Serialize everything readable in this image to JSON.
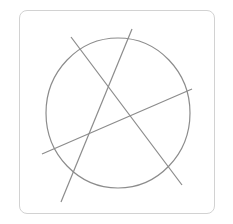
{
  "figure": {
    "stroke_color": "#8c8c8c",
    "frame_color": "#d2d2d2",
    "circle": {
      "cx": 118,
      "cy": 113,
      "rx": 72,
      "ry": 75
    },
    "lines": [
      {
        "x1": 71,
        "y1": 37,
        "x2": 182,
        "y2": 185
      },
      {
        "x1": 132,
        "y1": 29,
        "x2": 61,
        "y2": 202
      },
      {
        "x1": 42,
        "y1": 154,
        "x2": 192,
        "y2": 89
      }
    ]
  }
}
